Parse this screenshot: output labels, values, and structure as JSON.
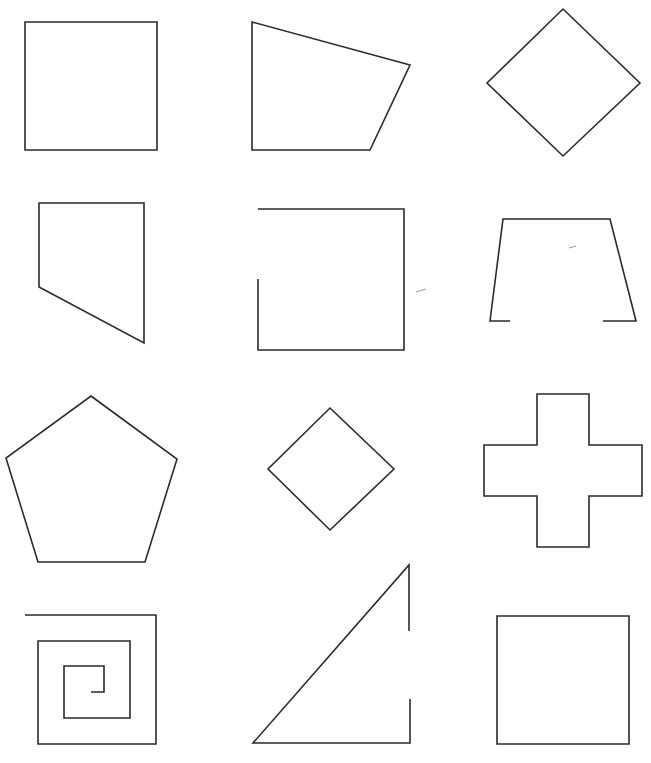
{
  "figure": {
    "width": 651,
    "height": 763,
    "stroke_color": "#2b2b2b",
    "background": "#ffffff",
    "layout": "4 rows x 3 columns grid of outline shapes"
  },
  "shapes": [
    {
      "id": "square-top-left",
      "kind": "square",
      "closed": true,
      "points": "25,22 157,22 157,150 25,150"
    },
    {
      "id": "irregular-quadrilateral",
      "kind": "quadrilateral",
      "closed": true,
      "points": "252,22 410,65 370,150 252,150"
    },
    {
      "id": "diamond-large",
      "kind": "rhombus",
      "closed": true,
      "points": "563,9 640,83 563,156 487,83"
    },
    {
      "id": "right-trapezoid-pentagon",
      "kind": "quadrilateral",
      "closed": true,
      "points": "39,203 144,203 144,343 39,287"
    },
    {
      "id": "open-square",
      "kind": "open-square",
      "closed": false,
      "points": "258,209 404,209 404,350 258,350 258,279"
    },
    {
      "id": "open-trapezoid",
      "kind": "open-trapezoid",
      "closed": false,
      "points": "510,321 490,321 503,219 610,219 636,321 603,321"
    },
    {
      "id": "pentagon",
      "kind": "pentagon",
      "closed": true,
      "points": "91,396 177,459 145,562 38,562 6,458"
    },
    {
      "id": "diamond-small",
      "kind": "rhombus",
      "closed": true,
      "points": "330,408 394,469 330,530 268,469"
    },
    {
      "id": "cross",
      "kind": "cross",
      "closed": true,
      "points": "537,394 589,394 589,445 642,445 642,496 589,496 589,547 537,547 537,496 484,496 484,445 537,445"
    },
    {
      "id": "square-spiral",
      "kind": "spiral",
      "closed": false,
      "points": "25,615 156,615 156,744 38,744 38,641 130,641 130,718 64,718 64,666 104,666 104,692 91,692"
    },
    {
      "id": "open-triangle",
      "kind": "open-triangle",
      "closed": false,
      "points": "409,631 409,565 253,743 410,743 410,699"
    },
    {
      "id": "square-bottom-right",
      "kind": "square",
      "closed": true,
      "points": "497,616 629,616 629,744 497,744"
    }
  ],
  "specks": [
    {
      "id": "dash-mid-right",
      "points": "416,292 426,289"
    },
    {
      "id": "dash-trapezoid-inner",
      "points": "569,248 576,246"
    }
  ]
}
